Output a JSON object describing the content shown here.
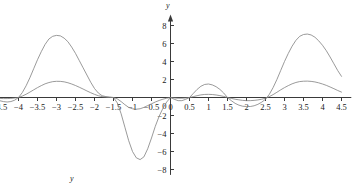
{
  "figure": {
    "y_axis_label": "y",
    "bottom_label": "y",
    "axis_color": "#3a3a3a",
    "curve_color": "#808080",
    "text_color": "#1a1a1a"
  },
  "chart_data": {
    "type": "line",
    "title": "",
    "xlabel": "",
    "ylabel": "y",
    "xlim": [
      -4.6,
      4.6
    ],
    "ylim": [
      -8.6,
      9.0
    ],
    "grid": false,
    "legend": "none",
    "x_ticks": [
      -4.5,
      -4,
      -3.5,
      -3,
      -2.5,
      -2,
      -1.5,
      -1,
      -0.5,
      0,
      0.5,
      1,
      1.5,
      2,
      2.5,
      3,
      3.5,
      4,
      4.5
    ],
    "x_tick_labels": [
      "−4.5",
      "−4",
      "−3.5",
      "−3",
      "−2.5",
      "−2",
      "−1.5",
      "−1",
      "−0.5",
      "0",
      "0.5",
      "1",
      "1.5",
      "2",
      "2.5",
      "3",
      "3.5",
      "4",
      "4.5"
    ],
    "y_ticks": [
      -8,
      -6,
      -4,
      -2,
      0,
      2,
      4,
      6,
      8
    ],
    "y_tick_labels": [
      "−8",
      "−6",
      "−4",
      "−2",
      "0",
      "2",
      "4",
      "6",
      "8"
    ],
    "series": [
      {
        "name": "large-amplitude-curve",
        "color": "#808080",
        "zeros": [
          -4.0,
          -1.5,
          0.0,
          0.5,
          1.5,
          2.5,
          4.0
        ],
        "peaks": [
          {
            "x": -2.5,
            "y": 6.9
          },
          {
            "x": 1.0,
            "y": 1.5
          },
          {
            "x": 3.75,
            "y": 7.05
          }
        ],
        "troughs": [
          {
            "x": -4.3,
            "y": -0.5
          },
          {
            "x": -0.8,
            "y": -6.9
          },
          {
            "x": 2.1,
            "y": -1.0
          }
        ],
        "x": [
          -4.5,
          -4.4,
          -4.3,
          -4.2,
          -4.1,
          -4.0,
          -3.9,
          -3.8,
          -3.7,
          -3.6,
          -3.5,
          -3.4,
          -3.3,
          -3.2,
          -3.1,
          -3.0,
          -2.9,
          -2.8,
          -2.7,
          -2.6,
          -2.5,
          -2.4,
          -2.3,
          -2.2,
          -2.1,
          -2.0,
          -1.9,
          -1.8,
          -1.7,
          -1.6,
          -1.5,
          -1.4,
          -1.3,
          -1.2,
          -1.1,
          -1.0,
          -0.9,
          -0.8,
          -0.7,
          -0.6,
          -0.5,
          -0.4,
          -0.3,
          -0.2,
          -0.1,
          0.0,
          0.1,
          0.2,
          0.3,
          0.4,
          0.5,
          0.6,
          0.7,
          0.8,
          0.9,
          1.0,
          1.1,
          1.2,
          1.3,
          1.4,
          1.5,
          1.6,
          1.7,
          1.8,
          1.9,
          2.0,
          2.1,
          2.2,
          2.3,
          2.4,
          2.5,
          2.6,
          2.7,
          2.8,
          2.9,
          3.0,
          3.1,
          3.2,
          3.3,
          3.4,
          3.5,
          3.6,
          3.7,
          3.8,
          3.9,
          4.0,
          4.1,
          4.2,
          4.3,
          4.4,
          4.5
        ],
        "y": [
          -0.35,
          -0.45,
          -0.5,
          -0.45,
          -0.3,
          0.0,
          0.55,
          1.3,
          2.2,
          3.2,
          4.2,
          5.1,
          5.9,
          6.5,
          6.8,
          6.9,
          6.85,
          6.6,
          6.2,
          5.6,
          4.9,
          4.1,
          3.3,
          2.5,
          1.7,
          1.0,
          0.5,
          0.2,
          0.1,
          0.05,
          0.0,
          -0.6,
          -1.8,
          -3.3,
          -4.8,
          -6.0,
          -6.7,
          -6.9,
          -6.6,
          -5.7,
          -4.5,
          -3.2,
          -2.1,
          -1.2,
          -0.5,
          0.0,
          -0.2,
          -0.35,
          -0.35,
          -0.2,
          0.0,
          0.45,
          0.9,
          1.25,
          1.45,
          1.5,
          1.4,
          1.2,
          0.9,
          0.5,
          0.0,
          -0.35,
          -0.65,
          -0.85,
          -0.97,
          -1.0,
          -1.0,
          -0.92,
          -0.76,
          -0.52,
          -0.2,
          0.35,
          1.1,
          2.0,
          3.0,
          4.0,
          4.9,
          5.7,
          6.35,
          6.8,
          7.0,
          7.05,
          6.95,
          6.7,
          6.3,
          5.8,
          5.2,
          4.5,
          3.75,
          3.0,
          2.35
        ]
      },
      {
        "name": "small-amplitude-curve",
        "color": "#808080",
        "zeros": [
          -4.0,
          -1.5,
          0.0,
          0.5,
          1.5,
          2.5,
          4.0
        ],
        "peaks": [
          {
            "x": -2.5,
            "y": 1.8
          },
          {
            "x": 1.0,
            "y": 0.35
          },
          {
            "x": 3.75,
            "y": 1.82
          }
        ],
        "troughs": [
          {
            "x": -0.9,
            "y": -1.3
          },
          {
            "x": 2.1,
            "y": -0.35
          }
        ],
        "x": [
          -4.5,
          -4.4,
          -4.3,
          -4.2,
          -4.1,
          -4.0,
          -3.9,
          -3.8,
          -3.7,
          -3.6,
          -3.5,
          -3.4,
          -3.3,
          -3.2,
          -3.1,
          -3.0,
          -2.9,
          -2.8,
          -2.7,
          -2.6,
          -2.5,
          -2.4,
          -2.3,
          -2.2,
          -2.1,
          -2.0,
          -1.9,
          -1.8,
          -1.7,
          -1.6,
          -1.5,
          -1.4,
          -1.3,
          -1.2,
          -1.1,
          -1.0,
          -0.9,
          -0.8,
          -0.7,
          -0.6,
          -0.5,
          -0.4,
          -0.3,
          -0.2,
          -0.1,
          0.0,
          0.1,
          0.2,
          0.3,
          0.4,
          0.5,
          0.6,
          0.7,
          0.8,
          0.9,
          1.0,
          1.1,
          1.2,
          1.3,
          1.4,
          1.5,
          1.6,
          1.7,
          1.8,
          1.9,
          2.0,
          2.1,
          2.2,
          2.3,
          2.4,
          2.5,
          2.6,
          2.7,
          2.8,
          2.9,
          3.0,
          3.1,
          3.2,
          3.3,
          3.4,
          3.5,
          3.6,
          3.7,
          3.8,
          3.9,
          4.0,
          4.1,
          4.2,
          4.3,
          4.4,
          4.5
        ],
        "y": [
          -0.1,
          -0.12,
          -0.12,
          -0.1,
          -0.06,
          0.0,
          0.16,
          0.36,
          0.6,
          0.85,
          1.1,
          1.32,
          1.52,
          1.66,
          1.76,
          1.8,
          1.79,
          1.74,
          1.64,
          1.5,
          1.33,
          1.14,
          0.94,
          0.73,
          0.53,
          0.35,
          0.2,
          0.1,
          0.04,
          0.01,
          0.0,
          -0.15,
          -0.45,
          -0.8,
          -1.1,
          -1.25,
          -1.3,
          -1.25,
          -1.1,
          -0.9,
          -0.7,
          -0.5,
          -0.33,
          -0.19,
          -0.08,
          0.0,
          -0.05,
          -0.08,
          -0.08,
          -0.05,
          0.0,
          0.1,
          0.2,
          0.29,
          0.34,
          0.35,
          0.33,
          0.28,
          0.21,
          0.12,
          0.0,
          -0.1,
          -0.19,
          -0.26,
          -0.32,
          -0.35,
          -0.35,
          -0.32,
          -0.27,
          -0.19,
          -0.08,
          0.1,
          0.32,
          0.58,
          0.85,
          1.1,
          1.32,
          1.52,
          1.67,
          1.77,
          1.81,
          1.82,
          1.79,
          1.73,
          1.63,
          1.5,
          1.35,
          1.17,
          0.98,
          0.78,
          0.6
        ]
      }
    ]
  }
}
